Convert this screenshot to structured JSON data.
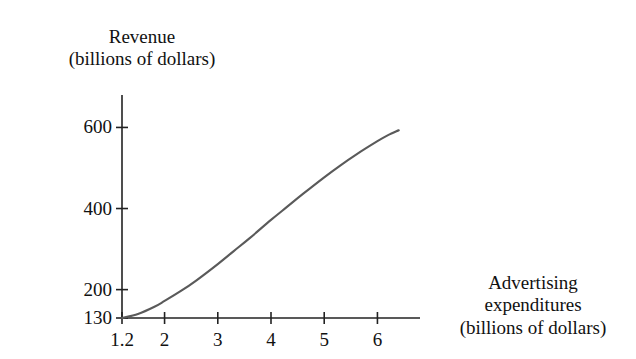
{
  "figure": {
    "background_color": "#ffffff",
    "axis_color": "#222222",
    "curve_color": "#5a5a5a",
    "text_color": "#111111"
  },
  "axes": {
    "y_title_line1": "Revenue",
    "y_title_line2": "(billions of dollars)",
    "x_title_line1": "Advertising",
    "x_title_line2": "expenditures",
    "x_title_line3": "(billions of dollars)"
  },
  "chart_data": {
    "type": "line",
    "title": "",
    "subtitle": "",
    "xlabel": "Advertising expenditures (billions of dollars)",
    "ylabel": "Revenue (billions of dollars)",
    "xlim": [
      1.2,
      6.8
    ],
    "ylim": [
      130,
      680
    ],
    "grid": false,
    "legend": null,
    "x_ticks": [
      1.2,
      2,
      3,
      4,
      5,
      6
    ],
    "x_tick_labels": [
      "1.2",
      "2",
      "3",
      "4",
      "5",
      "6"
    ],
    "y_ticks": [
      130,
      200,
      400,
      600
    ],
    "y_tick_labels": [
      "130",
      "200",
      "400",
      "600"
    ],
    "series": [
      {
        "name": "Revenue",
        "color": "#5a5a5a",
        "x": [
          1.2,
          1.5,
          1.8,
          2.0,
          2.3,
          2.6,
          3.0,
          3.3,
          3.6,
          4.0,
          4.3,
          4.6,
          5.0,
          5.3,
          5.6,
          6.0,
          6.2,
          6.4
        ],
        "values": [
          130,
          140,
          157,
          172,
          196,
          223,
          263,
          295,
          327,
          372,
          404,
          436,
          477,
          506,
          533,
          566,
          581,
          593
        ]
      }
    ],
    "annotations": [
      {
        "text": "S-shaped (logistic) response curve",
        "visible": false
      }
    ]
  },
  "y_tick_items": [
    {
      "label": "600",
      "value": 600
    },
    {
      "label": "400",
      "value": 400
    },
    {
      "label": "200",
      "value": 200
    },
    {
      "label": "130",
      "value": 130
    }
  ],
  "x_tick_items": [
    {
      "label": "1.2",
      "value": 1.2
    },
    {
      "label": "2",
      "value": 2
    },
    {
      "label": "3",
      "value": 3
    },
    {
      "label": "4",
      "value": 4
    },
    {
      "label": "5",
      "value": 5
    },
    {
      "label": "6",
      "value": 6
    }
  ]
}
